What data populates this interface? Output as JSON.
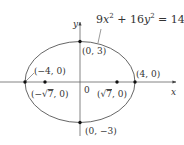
{
  "figure": {
    "equation": {
      "coef_x": "9",
      "var_x": "x",
      "exp_x": "2",
      "plus": " + ",
      "coef_y": "16",
      "var_y": "y",
      "exp_y": "2",
      "rhs": " = 144"
    },
    "axes": {
      "x_label": "x",
      "y_label": "y",
      "origin_label": "0"
    },
    "points": [
      {
        "id": "top-vertex",
        "label": "(0, 3)"
      },
      {
        "id": "bottom-vertex",
        "label": "(0, −3)"
      },
      {
        "id": "left-vertex",
        "label": "(−4, 0)"
      },
      {
        "id": "right-vertex",
        "label": "(4, 0)"
      },
      {
        "id": "left-focus",
        "label_pre": "(−",
        "label_rad": "7",
        "label_post": ", 0)"
      },
      {
        "id": "right-focus",
        "label_pre": "(",
        "label_rad": "7",
        "label_post": ", 0)"
      }
    ],
    "colors": {
      "stroke": "#555555",
      "text": "#333333",
      "point": "#111111"
    }
  }
}
